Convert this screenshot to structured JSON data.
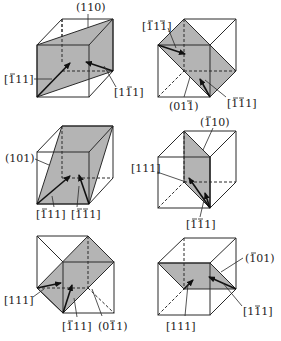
{
  "figure": {
    "cubes": [
      {
        "id": "cube-1",
        "plane": "(110)",
        "plane_bars": [],
        "directions": [
          {
            "label": "[111]",
            "bars": [
              0
            ]
          },
          {
            "label": "[111]",
            "bars": [
              1
            ]
          }
        ]
      },
      {
        "id": "cube-2",
        "plane": "(011)",
        "plane_bars": [
          2
        ],
        "directions": [
          {
            "label": "[111]",
            "bars": [
              0,
              2
            ]
          },
          {
            "label": "[111]",
            "bars": [
              0,
              1
            ]
          }
        ]
      },
      {
        "id": "cube-3",
        "plane": "(101)",
        "plane_bars": [],
        "directions": [
          {
            "label": "[111]",
            "bars": [
              0
            ]
          },
          {
            "label": "[111]",
            "bars": [
              0,
              1
            ]
          }
        ]
      },
      {
        "id": "cube-4",
        "plane": "(110)",
        "plane_bars": [
          0
        ],
        "directions": [
          {
            "label": "[111]",
            "bars": []
          },
          {
            "label": "[111]",
            "bars": [
              0,
              1
            ]
          }
        ]
      },
      {
        "id": "cube-5",
        "plane": "(011)",
        "plane_bars": [
          2
        ],
        "directions": [
          {
            "label": "[111]",
            "bars": []
          },
          {
            "label": "[111]",
            "bars": [
              0
            ]
          }
        ]
      },
      {
        "id": "cube-6",
        "plane": "(101)",
        "plane_bars": [
          0
        ],
        "directions": [
          {
            "label": "[111]",
            "bars": []
          },
          {
            "label": "[111]",
            "bars": [
              1
            ]
          }
        ]
      }
    ],
    "labels_rendered": {
      "c1_plane": "(110)",
      "c1_dir_a": "[111]",
      "c1_dir_b": "[111]",
      "c2_plane": "(011)",
      "c2_dir_a": "[111]",
      "c2_dir_b": "[111]",
      "c3_plane": "(101)",
      "c3_dir_a": "[111]",
      "c3_dir_b": "[111]",
      "c4_plane": "(110)",
      "c4_dir_a": "[111]",
      "c4_dir_b": "[111]",
      "c5_plane": "(011)",
      "c5_dir_a": "[111]",
      "c5_dir_b": "[111]",
      "c6_plane": "(101)",
      "c6_dir_a": "[111]",
      "c6_dir_b": "[111]"
    },
    "colors": {
      "plane_fill": "#b4b4b4",
      "line": "#2a2a2a",
      "background": "#ffffff"
    }
  }
}
